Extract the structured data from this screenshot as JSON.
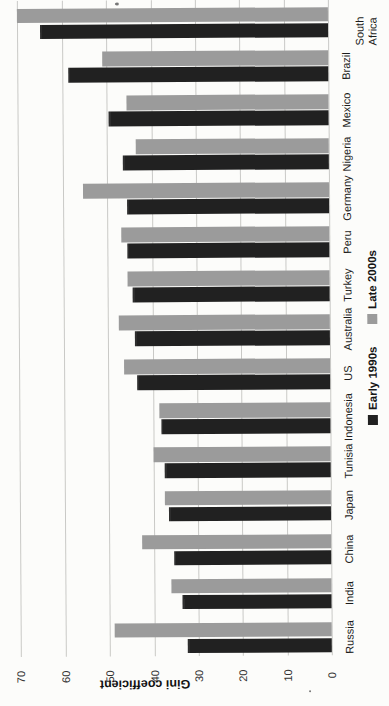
{
  "chart_data": {
    "type": "bar",
    "note": "Scanned grouped bar chart rotated 90 degrees to portrait; value axis runs right-to-left (0 at right, 70 at left); countries listed top-to-bottom, sorted ascending (bottom-to-top) by Early 1990s value",
    "value_axis": {
      "label": "Gini coefficient",
      "min": 0,
      "max": 70,
      "ticks": [
        70,
        60,
        50,
        40,
        30,
        20,
        10,
        0
      ],
      "tick_labels": [
        "70",
        "60",
        "50",
        "40",
        "30",
        "20",
        "10",
        "0"
      ],
      "grid": true
    },
    "legend": [
      {
        "label": "Early 1990s",
        "color": "#212121"
      },
      {
        "label": "Late 2000s",
        "color": "#9b9b9b"
      }
    ],
    "series_names": [
      "Early 1990s",
      "Late 2000s"
    ],
    "groups": [
      {
        "label": "South Africa",
        "early_1990s": 65,
        "late_2000s": 70,
        "wrap": true
      },
      {
        "label": "Brazil",
        "early_1990s": 58.5,
        "late_2000s": 51
      },
      {
        "label": "Mexico",
        "early_1990s": 49.5,
        "late_2000s": 45.5
      },
      {
        "label": "Nigeria",
        "early_1990s": 46.5,
        "late_2000s": 43.5
      },
      {
        "label": "Germany",
        "early_1990s": 45.5,
        "late_2000s": 55.5
      },
      {
        "label": "Peru",
        "early_1990s": 45.5,
        "late_2000s": 47
      },
      {
        "label": "Turkey",
        "early_1990s": 44.5,
        "late_2000s": 45.5
      },
      {
        "label": "Australia",
        "early_1990s": 44,
        "late_2000s": 47.5
      },
      {
        "label": "US",
        "early_1990s": 43.5,
        "late_2000s": 46.5
      },
      {
        "label": "Indonesia",
        "early_1990s": 38,
        "late_2000s": 38.5
      },
      {
        "label": "Tunisia",
        "early_1990s": 37.5,
        "late_2000s": 40
      },
      {
        "label": "Japan",
        "early_1990s": 36.5,
        "late_2000s": 37.5
      },
      {
        "label": "China",
        "early_1990s": 35.5,
        "late_2000s": 42.5
      },
      {
        "label": "India",
        "early_1990s": 33.5,
        "late_2000s": 36
      },
      {
        "label": "Russia",
        "early_1990s": 32.5,
        "late_2000s": 49
      }
    ]
  }
}
